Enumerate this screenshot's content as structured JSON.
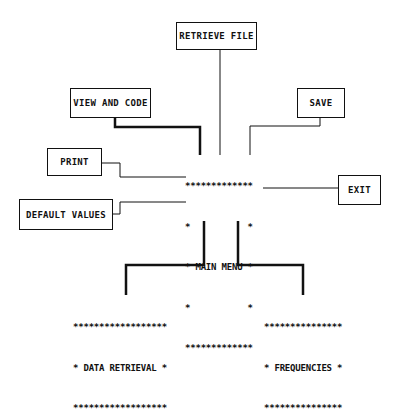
{
  "diagram": {
    "center": {
      "border_top": "*************",
      "row1": "*           *",
      "label_row": "* MAIN MENU *",
      "row3": "*           *",
      "border_bottom": "*************"
    },
    "boxes": {
      "retrieve_file": "RETRIEVE FILE",
      "view_and_code": "VIEW AND CODE",
      "save": "SAVE",
      "print": "PRINT",
      "exit": "EXIT",
      "default_values": "DEFAULT VALUES"
    },
    "submenus": {
      "data_retrieval": {
        "border_top": "******************",
        "label_row": "* DATA RETRIEVAL *",
        "border_bottom": "******************"
      },
      "frequencies": {
        "border_top": "***************",
        "label_row": "* FREQUENCIES *",
        "border_bottom": "***************"
      }
    }
  }
}
